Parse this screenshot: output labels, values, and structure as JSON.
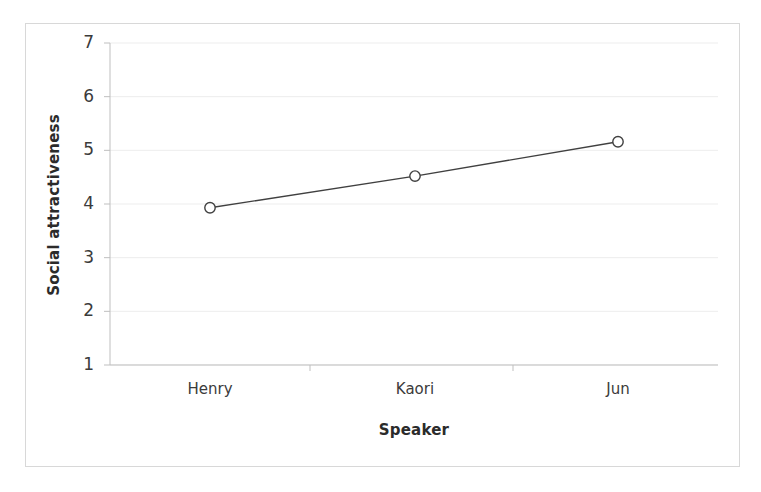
{
  "chart_data": {
    "type": "line",
    "title": "",
    "subtitle": "",
    "xlabel": "Speaker",
    "ylabel": "Social attractiveness",
    "categories": [
      "Henry",
      "Kaori",
      "Jun"
    ],
    "series": [
      {
        "name": "Social attractiveness",
        "values": [
          3.93,
          4.52,
          5.16
        ],
        "marker": "open-circle",
        "line_color": "#404040",
        "marker_color": "#404040"
      }
    ],
    "ylim": [
      1,
      7
    ],
    "yticks": [
      1,
      2,
      3,
      4,
      5,
      6,
      7
    ],
    "ytick_labels": [
      "1",
      "2",
      "3",
      "4",
      "5",
      "6",
      "7"
    ],
    "grid": true,
    "grid_axis": "y",
    "grid_color": "#ededed",
    "legend": false,
    "legend_position": "none",
    "axis_color": "#bfbfbf",
    "frame_color": "#d8d8d8",
    "background": "#ffffff"
  },
  "axis": {
    "y_title": "Social attractiveness",
    "x_title": "Speaker"
  }
}
